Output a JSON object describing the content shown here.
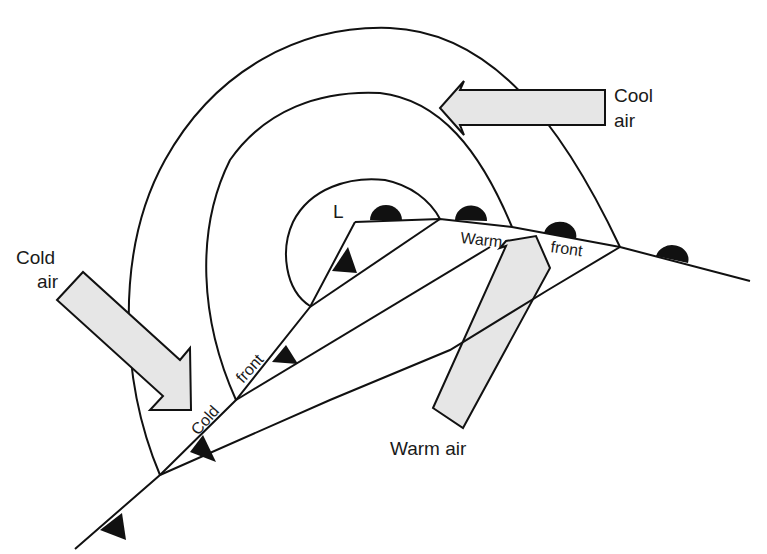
{
  "figure": {
    "type": "weather-front-diagram"
  },
  "labels": {
    "low_pressure": "L",
    "cool_air_line1": "Cool",
    "cool_air_line2": "air",
    "cold_air_line1": "Cold",
    "cold_air_line2": "air",
    "warm_air": "Warm air",
    "warm_front_word1": "Warm",
    "warm_front_word2": "front",
    "cold_front_word1": "Cold",
    "cold_front_word2": "front"
  },
  "symbols": {
    "cold_front_marker": "filled-triangle",
    "warm_front_marker": "filled-semicircle"
  },
  "colors": {
    "line": "#111111",
    "arrow_fill": "#e6e6e6",
    "background": "#ffffff"
  }
}
